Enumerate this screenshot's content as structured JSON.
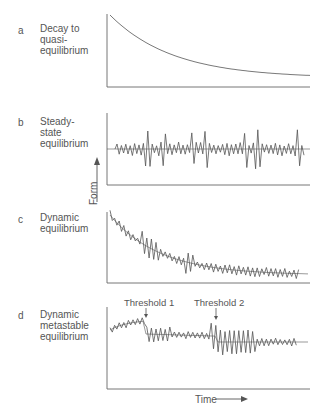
{
  "panels": [
    {
      "letter": "a",
      "title_lines": [
        "Decay to",
        "quasi-",
        "equilibrium"
      ]
    },
    {
      "letter": "b",
      "title_lines": [
        "Steady-",
        "state",
        "equilibrium"
      ]
    },
    {
      "letter": "c",
      "title_lines": [
        "Dynamic",
        "equilibrium"
      ]
    },
    {
      "letter": "d",
      "title_lines": [
        "Dynamic",
        "metastable",
        "equilibrium"
      ],
      "annotations": [
        "Threshold 1",
        "Threshold 2"
      ]
    }
  ],
  "axes": {
    "y_label": "Form",
    "x_label": "Time"
  },
  "colors": {
    "line": "#555555",
    "axis": "#666666"
  },
  "chart_data": [
    {
      "type": "line",
      "title": "Decay to quasi-equilibrium",
      "xlabel": "Time",
      "ylabel": "Form",
      "description": "smooth exponential decay approaching a constant"
    },
    {
      "type": "line",
      "title": "Steady-state equilibrium",
      "xlabel": "Time",
      "ylabel": "Form",
      "description": "fluctuations around a constant mean"
    },
    {
      "type": "line",
      "title": "Dynamic equilibrium",
      "xlabel": "Time",
      "ylabel": "Form",
      "description": "fluctuations around a decaying mean"
    },
    {
      "type": "line",
      "title": "Dynamic metastable equilibrium",
      "xlabel": "Time",
      "ylabel": "Form",
      "description": "fluctuations around a mean with step changes at thresholds",
      "annotations": [
        "Threshold 1",
        "Threshold 2"
      ]
    }
  ]
}
